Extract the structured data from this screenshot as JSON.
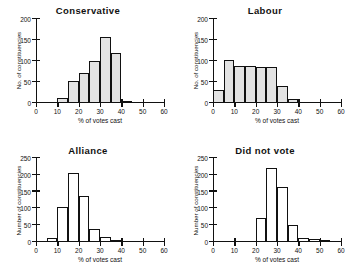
{
  "figure": {
    "panel_count": 4,
    "bin_width": 5,
    "shared_xlabel": "% of votes cast"
  },
  "chart_data": [
    {
      "type": "bar",
      "title": "Conservative",
      "xlabel": "% of votes cast",
      "ylabel": "No. of constituencies",
      "xlim": [
        0,
        60
      ],
      "ylim": [
        0,
        200
      ],
      "xticks": [
        0,
        10,
        20,
        30,
        40,
        50,
        60
      ],
      "yticks": [
        0,
        50,
        100,
        150,
        200
      ],
      "grid": false,
      "legend": "none",
      "bar_style": "filled",
      "bin_edges": [
        10,
        15,
        20,
        25,
        30,
        35,
        40,
        45
      ],
      "categories": [
        "10-15",
        "15-20",
        "20-25",
        "25-30",
        "30-35",
        "35-40",
        "40-45"
      ],
      "values": [
        13,
        53,
        72,
        101,
        157,
        120,
        3
      ]
    },
    {
      "type": "bar",
      "title": "Labour",
      "xlabel": "% of votes cast",
      "ylabel": "No. of constituencies",
      "xlim": [
        0,
        60
      ],
      "ylim": [
        0,
        200
      ],
      "xticks": [
        0,
        10,
        20,
        30,
        40,
        50,
        60
      ],
      "yticks": [
        0,
        50,
        100,
        150,
        200
      ],
      "grid": false,
      "legend": "none",
      "bar_style": "filled",
      "bin_edges": [
        0,
        5,
        10,
        15,
        20,
        25,
        30,
        35,
        40
      ],
      "categories": [
        "0-5",
        "5-10",
        "10-15",
        "15-20",
        "20-25",
        "25-30",
        "30-35",
        "35-40"
      ],
      "values": [
        32,
        103,
        88,
        87,
        86,
        85,
        40,
        9
      ]
    },
    {
      "type": "bar",
      "title": "Alliance",
      "xlabel": "% of votes cast",
      "ylabel": "Number of constituencies",
      "xlim": [
        0,
        60
      ],
      "ylim": [
        0,
        250
      ],
      "xticks": [
        0,
        10,
        20,
        30,
        40,
        50,
        60
      ],
      "yticks": [
        0,
        50,
        100,
        150,
        200,
        250
      ],
      "grid": false,
      "legend": "none",
      "bar_style": "hollow",
      "bin_edges": [
        5,
        10,
        15,
        20,
        25,
        30,
        35,
        40
      ],
      "categories": [
        "5-10",
        "10-15",
        "15-20",
        "20-25",
        "25-30",
        "30-35",
        "35-40"
      ],
      "values": [
        11,
        105,
        206,
        137,
        40,
        16,
        5
      ]
    },
    {
      "type": "bar",
      "title": "Did not vote",
      "xlabel": "% of votes cast",
      "ylabel": "Number of constituencies",
      "xlim": [
        0,
        60
      ],
      "ylim": [
        0,
        250
      ],
      "xticks": [
        0,
        10,
        20,
        30,
        40,
        50,
        60
      ],
      "yticks": [
        0,
        50,
        100,
        150,
        200,
        250
      ],
      "grid": false,
      "legend": "none",
      "bar_style": "hollow",
      "bin_edges": [
        20,
        25,
        30,
        35,
        40,
        45,
        50,
        55
      ],
      "categories": [
        "20-25",
        "25-30",
        "30-35",
        "35-40",
        "40-45",
        "45-50",
        "50-55"
      ],
      "values": [
        71,
        219,
        163,
        51,
        13,
        8,
        4
      ]
    }
  ]
}
